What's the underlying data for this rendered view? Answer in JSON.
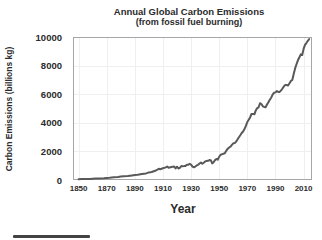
{
  "chart_data": {
    "type": "line",
    "title": "Annual Global Carbon Emissions",
    "subtitle": "(from fossil fuel burning)",
    "xlabel": "Year",
    "ylabel": "Carbon Emissions (billions kg)",
    "xlim": [
      1846,
      2016
    ],
    "ylim": [
      0,
      10000
    ],
    "xticks": [
      1850,
      1870,
      1890,
      1910,
      1930,
      1950,
      1970,
      1990,
      2010
    ],
    "yticks": [
      0,
      2000,
      4000,
      6000,
      8000,
      10000
    ],
    "grid": true,
    "legend": "none",
    "line_color": "#595959",
    "border_color": "#a6a6a6",
    "grid_color": "#f0eeee",
    "series": [
      {
        "name": "Global carbon emissions",
        "x": [
          1850,
          1852,
          1855,
          1858,
          1860,
          1862,
          1865,
          1868,
          1870,
          1872,
          1875,
          1878,
          1880,
          1882,
          1885,
          1888,
          1890,
          1892,
          1895,
          1898,
          1900,
          1902,
          1905,
          1907,
          1908,
          1910,
          1912,
          1913,
          1914,
          1916,
          1918,
          1919,
          1920,
          1921,
          1922,
          1923,
          1924,
          1925,
          1926,
          1927,
          1928,
          1929,
          1930,
          1931,
          1932,
          1933,
          1934,
          1935,
          1936,
          1937,
          1938,
          1939,
          1940,
          1941,
          1942,
          1943,
          1944,
          1945,
          1946,
          1947,
          1948,
          1949,
          1950,
          1951,
          1952,
          1953,
          1954,
          1955,
          1956,
          1957,
          1958,
          1959,
          1960,
          1961,
          1962,
          1963,
          1964,
          1965,
          1966,
          1967,
          1968,
          1969,
          1970,
          1971,
          1972,
          1973,
          1974,
          1975,
          1976,
          1977,
          1978,
          1979,
          1980,
          1981,
          1982,
          1983,
          1984,
          1985,
          1986,
          1987,
          1988,
          1989,
          1990,
          1991,
          1992,
          1993,
          1994,
          1995,
          1996,
          1997,
          1998,
          1999,
          2000,
          2001,
          2002,
          2003,
          2004,
          2005,
          2006,
          2007,
          2008,
          2009,
          2010,
          2011,
          2012,
          2013,
          2014
        ],
        "values": [
          54,
          62,
          68,
          75,
          91,
          97,
          114,
          128,
          147,
          163,
          188,
          203,
          236,
          257,
          272,
          319,
          356,
          372,
          419,
          465,
          534,
          560,
          663,
          784,
          750,
          819,
          880,
          943,
          850,
          912,
          936,
          806,
          932,
          803,
          845,
          970,
          963,
          975,
          983,
          1062,
          1065,
          1143,
          1070,
          940,
          889,
          939,
          1018,
          1062,
          1153,
          1214,
          1130,
          1209,
          1299,
          1334,
          1342,
          1391,
          1383,
          1160,
          1238,
          1392,
          1469,
          1419,
          1630,
          1767,
          1795,
          1841,
          1865,
          2043,
          2178,
          2270,
          2330,
          2454,
          2569,
          2580,
          2686,
          2833,
          2995,
          3130,
          3288,
          3393,
          3566,
          3780,
          4053,
          4208,
          4376,
          4614,
          4623,
          4596,
          4864,
          5026,
          5087,
          5369,
          5315,
          5152,
          5113,
          5094,
          5280,
          5439,
          5607,
          5752,
          5965,
          6097,
          6127,
          6217,
          6164,
          6162,
          6266,
          6398,
          6542,
          6651,
          6643,
          6610,
          6765,
          6927,
          6996,
          7416,
          7807,
          8093,
          8370,
          8566,
          8783,
          8740,
          9167,
          9449,
          9575,
          9735,
          9855
        ]
      }
    ]
  }
}
